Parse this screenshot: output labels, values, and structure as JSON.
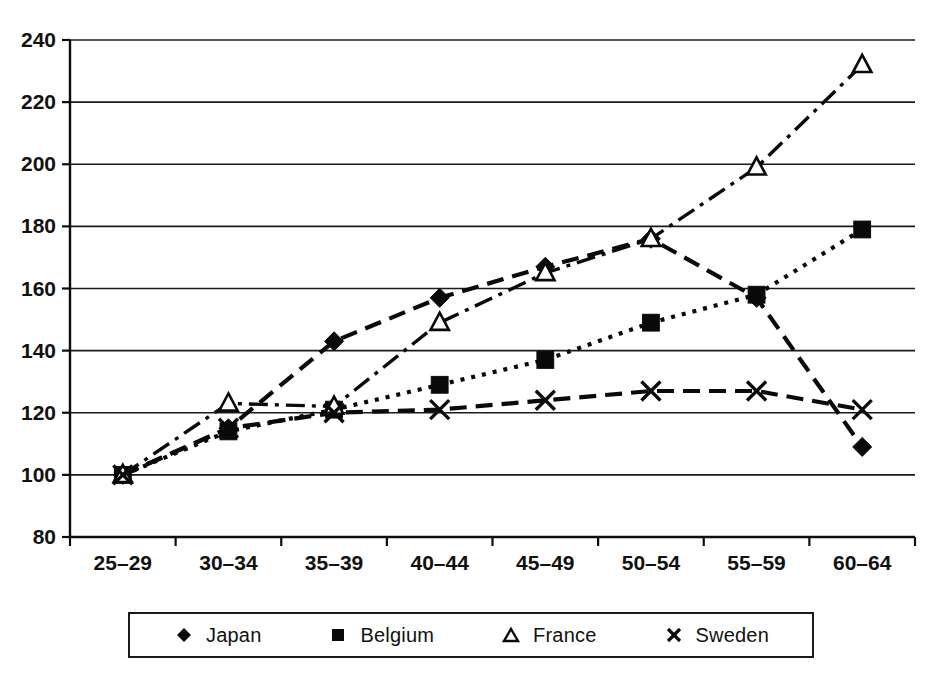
{
  "chart_data": {
    "type": "line",
    "title": "",
    "subtitle": "",
    "xlabel": "",
    "ylabel": "",
    "categories": [
      "25–29",
      "30–34",
      "35–39",
      "40–44",
      "45–49",
      "50–54",
      "55–59",
      "60–64"
    ],
    "ylim": [
      80,
      240
    ],
    "ytick_step": 20,
    "yticks": [
      80,
      100,
      120,
      140,
      160,
      180,
      200,
      220,
      240
    ],
    "ytick_labels": [
      "80",
      "100",
      "120",
      "140",
      "160",
      "180",
      "200",
      "220",
      "240"
    ],
    "grid": "horizontal",
    "legend_position": "bottom",
    "series": [
      {
        "name": "Japan",
        "marker": "filled-diamond",
        "line_style": "long-dash",
        "color": "#0a0a0a",
        "values": [
          100,
          115,
          143,
          157,
          167,
          176,
          157,
          109
        ]
      },
      {
        "name": "Belgium",
        "marker": "filled-square",
        "line_style": "dotted",
        "color": "#0a0a0a",
        "values": [
          100,
          114,
          121,
          129,
          137,
          149,
          158,
          179
        ]
      },
      {
        "name": "France",
        "marker": "open-triangle",
        "line_style": "dash-dot",
        "color": "#0a0a0a",
        "values": [
          100,
          123,
          122,
          149,
          165,
          176,
          199,
          232
        ]
      },
      {
        "name": "Sweden",
        "marker": "cross-x",
        "line_style": "long-dash",
        "color": "#0a0a0a",
        "values": [
          100,
          115,
          120,
          121,
          124,
          127,
          127,
          121
        ]
      }
    ]
  },
  "legend": {
    "items": [
      {
        "label": "Japan",
        "icon": "filled-diamond-icon"
      },
      {
        "label": "Belgium",
        "icon": "filled-square-icon"
      },
      {
        "label": "France",
        "icon": "open-triangle-icon"
      },
      {
        "label": "Sweden",
        "icon": "cross-x-icon"
      }
    ]
  }
}
